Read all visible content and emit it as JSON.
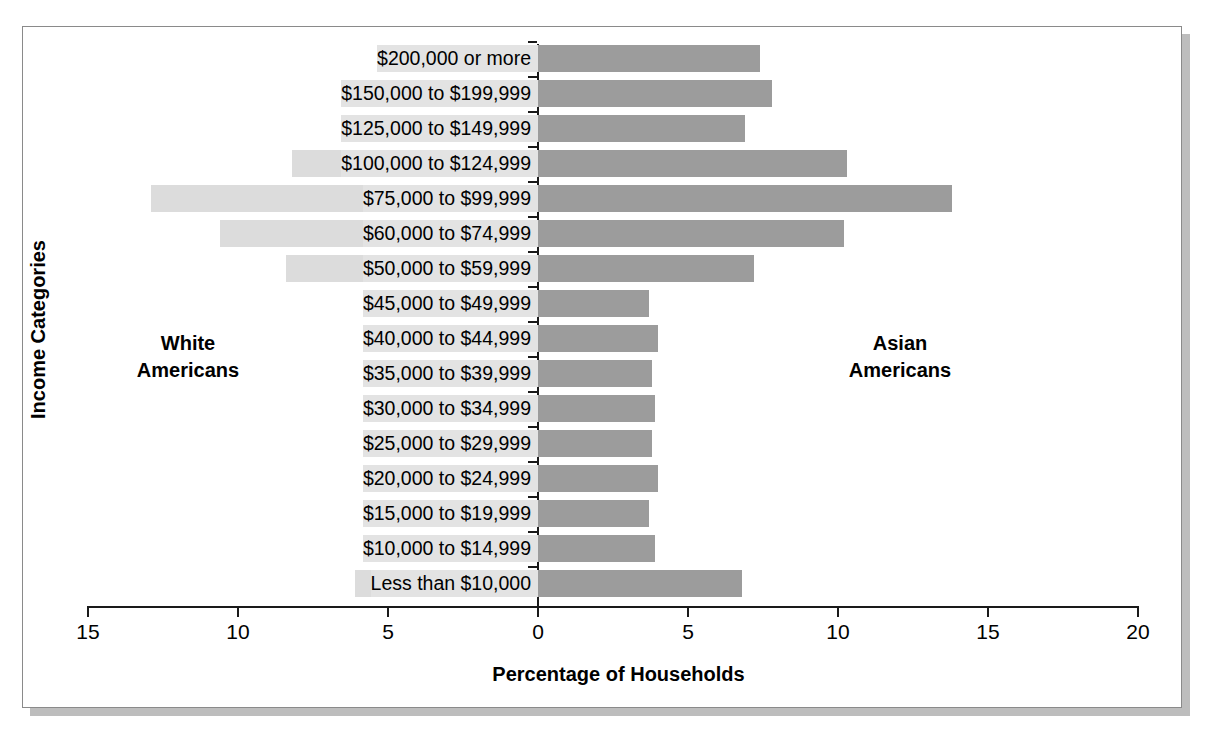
{
  "chart_data": {
    "type": "bar",
    "subtype": "population-pyramid",
    "title": "",
    "xlabel": "Percentage of Households",
    "ylabel": "Income Categories",
    "grid": false,
    "legend_position": "in-plot-annotations",
    "x_tick_labels": [
      "15",
      "10",
      "5",
      "0",
      "5",
      "10",
      "15",
      "20"
    ],
    "x_tick_values": [
      -15,
      -10,
      -5,
      0,
      5,
      10,
      15,
      20
    ],
    "xlim_left": 15,
    "xlim_right": 20,
    "categories": [
      "$200,000 or more",
      "$150,000 to $199,999",
      "$125,000 to $149,999",
      "$100,000 to $124,999",
      "$75,000 to $99,999",
      "$60,000 to $74,999",
      "$50,000 to $59,999",
      "$45,000 to $49,999",
      "$40,000 to $44,999",
      "$35,000 to $39,999",
      "$30,000 to $34,999",
      "$25,000 to $29,999",
      "$20,000 to $24,999",
      "$15,000 to $19,999",
      "$10,000 to $14,999",
      "Less than $10,000"
    ],
    "series": [
      {
        "name": "White Americans",
        "side": "left",
        "color": "#dcdcdc",
        "values": [
          4.5,
          4.6,
          4.6,
          8.2,
          12.9,
          10.6,
          8.4,
          5.0,
          5.1,
          5.1,
          5.1,
          5.0,
          5.1,
          5.0,
          5.1,
          6.1
        ]
      },
      {
        "name": "Asian Americans",
        "side": "right",
        "color": "#9c9c9c",
        "values": [
          7.4,
          7.8,
          6.9,
          10.3,
          13.8,
          10.2,
          7.2,
          3.7,
          4.0,
          3.8,
          3.9,
          3.8,
          4.0,
          3.7,
          3.9,
          6.8
        ]
      }
    ]
  },
  "annotations": {
    "left_label": "White\nAmericans",
    "right_label": "Asian\nAmericans"
  }
}
